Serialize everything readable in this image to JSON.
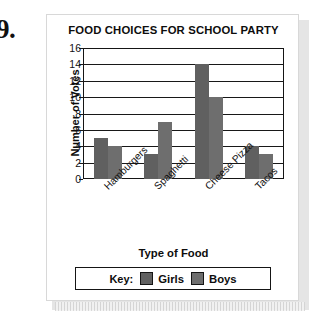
{
  "problem": {
    "number": "9."
  },
  "legend": {
    "key_label": "Key:",
    "entries": [
      {
        "name": "Girls",
        "color": "#606060"
      },
      {
        "name": "Boys",
        "color": "#6e6e6e"
      }
    ]
  },
  "chart_data": {
    "type": "bar",
    "title": "FOOD CHOICES FOR SCHOOL PARTY",
    "xlabel": "Type of Food",
    "ylabel": "Number of Votes",
    "categories": [
      "Hamburgers",
      "Spaghetti",
      "Cheese Pizza",
      "Tacos"
    ],
    "series": [
      {
        "name": "Girls",
        "color": "#606060",
        "values": [
          5,
          3,
          14,
          4
        ]
      },
      {
        "name": "Boys",
        "color": "#6e6e6e",
        "values": [
          4,
          7,
          10,
          3
        ]
      }
    ],
    "ylim": [
      0,
      16
    ],
    "yticks": [
      0,
      2,
      4,
      6,
      8,
      10,
      12,
      14,
      16
    ],
    "ytick_labels": [
      "0",
      "2",
      "4",
      "6",
      "8",
      "10",
      "12",
      "14",
      "16"
    ],
    "grid": true,
    "grid_axis": "y",
    "legend_position": "bottom",
    "xtick_rotation": -45
  }
}
